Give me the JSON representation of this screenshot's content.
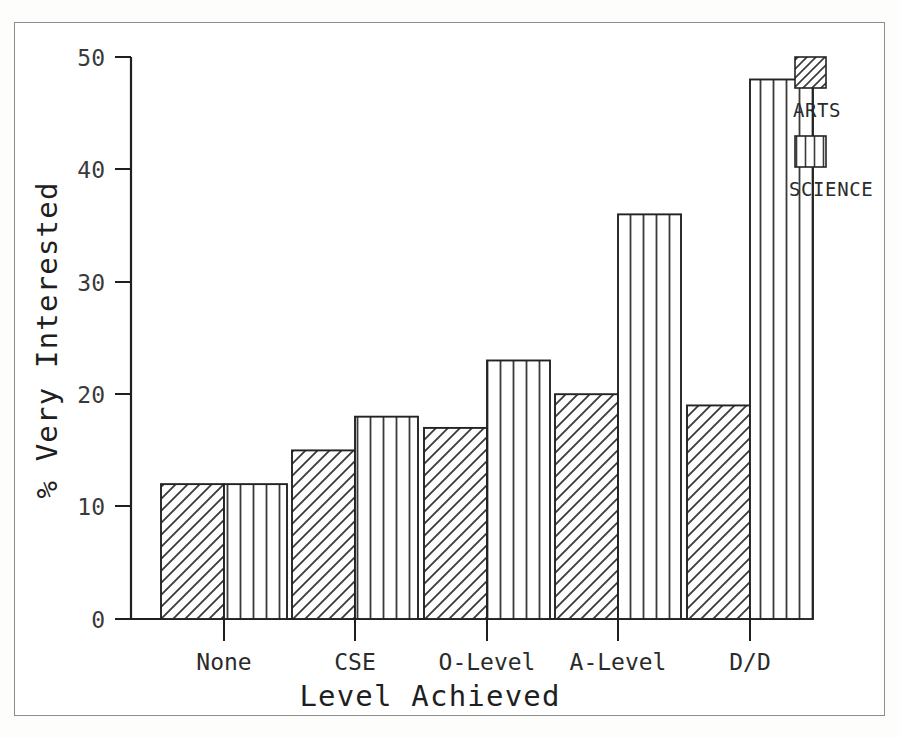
{
  "chart_data": {
    "type": "bar",
    "title": "",
    "xlabel": "Level Achieved",
    "ylabel": "% Very Interested",
    "categories": [
      "None",
      "CSE",
      "O-Level",
      "A-Level",
      "D/D"
    ],
    "series": [
      {
        "name": "ARTS",
        "values": [
          12,
          15,
          17,
          20,
          19
        ],
        "pattern": "diagonal-hatch"
      },
      {
        "name": "SCIENCE",
        "values": [
          12,
          18,
          23,
          36,
          48
        ],
        "pattern": "vertical-lines"
      }
    ],
    "ylim": [
      0,
      50
    ],
    "yticks": [
      0,
      10,
      20,
      30,
      40,
      50
    ],
    "ytick_labels": [
      "0",
      "10",
      "20",
      "30",
      "40",
      "50"
    ],
    "grid": false,
    "legend_position": "top-right-outside"
  },
  "legend": {
    "items": [
      {
        "label": "ARTS",
        "swatch": "diagonal-hatch-swatch"
      },
      {
        "label": "SCIENCE",
        "swatch": "vertical-lines-swatch"
      }
    ]
  },
  "axes": {
    "y_title": "% Very Interested",
    "x_title": "Level Achieved"
  },
  "colors": {
    "ink": "#232323",
    "paper": "#ffffff",
    "frame": "#8d8d8d"
  }
}
